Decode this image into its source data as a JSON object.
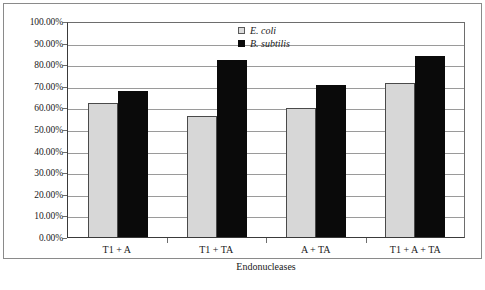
{
  "chart_data": {
    "type": "bar",
    "title": "",
    "xlabel": "Endonucleases",
    "ylabel": "",
    "categories": [
      "T1 + A",
      "T1 + TA",
      "A + TA",
      "T1 + A + TA"
    ],
    "series": [
      {
        "name": "E. coli",
        "color": "#d7d7d7",
        "values": [
          62.0,
          56.0,
          59.5,
          71.5
        ]
      },
      {
        "name": "B. subtilis",
        "color": "#0a0a0a",
        "values": [
          67.5,
          82.0,
          70.5,
          84.0
        ]
      }
    ],
    "ylim": [
      0,
      100
    ],
    "ytick_values": [
      0,
      10,
      20,
      30,
      40,
      50,
      60,
      70,
      80,
      90,
      100
    ],
    "ytick_labels": [
      "100.00%",
      "90.00%",
      "80.00%",
      "70.00%",
      "60.00%",
      "50.00%",
      "40.00%",
      "30.00%",
      "20.00%",
      "10.00%",
      "0.00%"
    ],
    "grid": true,
    "grid_axis": "y",
    "legend_position": "top-center-right",
    "legend_entries": [
      "E. coli",
      "B. subtilis"
    ],
    "annotations": []
  },
  "colors": {
    "ecoli_fill": "#d7d7d7",
    "ecoli_edge": "#4a4a4a",
    "bsubtilis_fill": "#0a0a0a",
    "gridline": "#9a9a9a",
    "axis": "#3a3a3a",
    "frame": "#8a8a8a",
    "background": "#ffffff",
    "text": "#1a1a1a"
  }
}
